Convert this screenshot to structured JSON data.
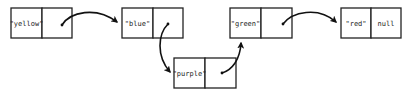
{
  "diagram": {
    "type": "linked-list",
    "nodes": [
      {
        "id": "node-yellow",
        "value": "\"yellow\"",
        "next_label": "",
        "has_pointer": true
      },
      {
        "id": "node-blue",
        "value": "\"blue\"",
        "next_label": "",
        "has_pointer": true
      },
      {
        "id": "node-purple",
        "value": "\"purple\"",
        "next_label": "",
        "has_pointer": true
      },
      {
        "id": "node-green",
        "value": "\"green\"",
        "next_label": "",
        "has_pointer": true
      },
      {
        "id": "node-red",
        "value": "\"red\"",
        "next_label": "null",
        "has_pointer": false
      }
    ],
    "edges": [
      {
        "from": "node-yellow",
        "to": "node-blue"
      },
      {
        "from": "node-blue",
        "to": "node-purple"
      },
      {
        "from": "node-purple",
        "to": "node-green"
      },
      {
        "from": "node-green",
        "to": "node-red"
      }
    ],
    "colors": {
      "stroke": "#222222",
      "arrow": "#111111",
      "background": "#ffffff"
    }
  }
}
